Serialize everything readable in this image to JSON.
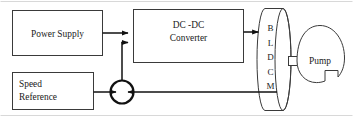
{
  "diagram": {
    "stroke_color": "#3a3a3a",
    "line_color": "#1c1c1c",
    "text_color": "#1a1a1a",
    "background": "#ffffff",
    "frame": {
      "visible": true,
      "color": "#d8d8d8"
    },
    "blocks": {
      "power_supply": {
        "label": "Power Supply"
      },
      "converter": {
        "line1": "DC -DC",
        "line2": "Converter"
      },
      "speed_reference": {
        "line1": "Speed",
        "line2": "Reference"
      },
      "motor": {
        "letters": [
          "B",
          "L",
          "D",
          "C",
          "M"
        ],
        "name": "BLDCM"
      },
      "pump": {
        "label": "Pump"
      },
      "summing_junction": {
        "label": ""
      }
    },
    "connections": [
      {
        "from": "power_supply",
        "to": "converter",
        "arrow": true
      },
      {
        "from": "summing_junction",
        "to": "converter",
        "arrow": true
      },
      {
        "from": "converter",
        "to": "motor",
        "arrow": true
      },
      {
        "from": "speed_reference",
        "to": "summing_junction",
        "arrow": true
      },
      {
        "from": "motor",
        "to": "summing_junction",
        "arrow": true
      },
      {
        "from": "motor",
        "to": "pump",
        "arrow": false
      }
    ]
  }
}
